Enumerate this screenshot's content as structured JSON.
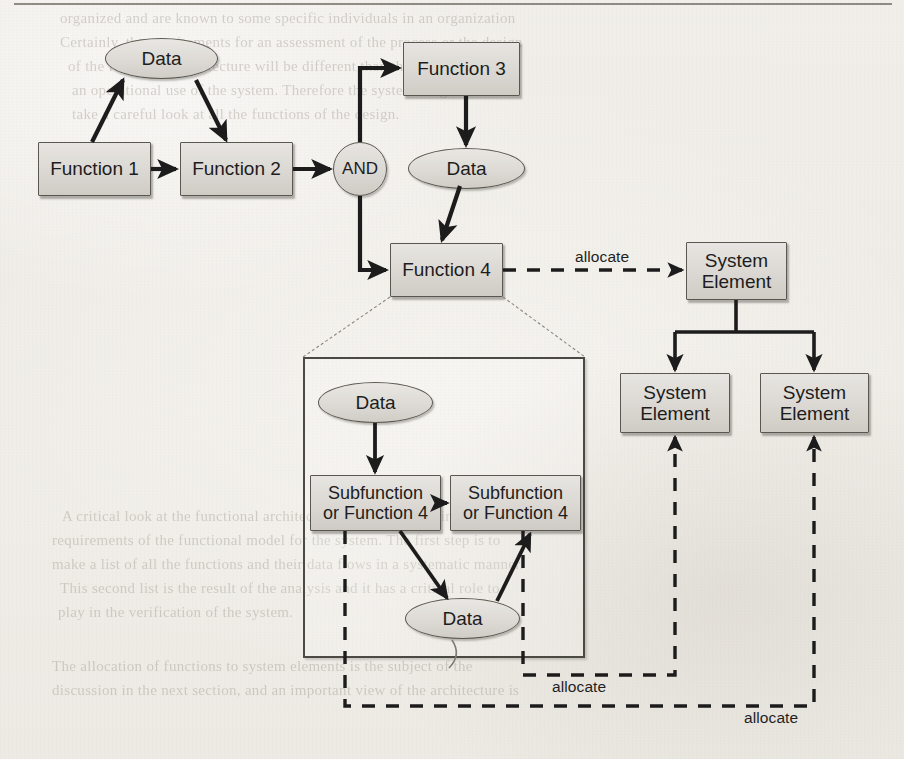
{
  "page": {
    "width": 904,
    "height": 759,
    "background_color": "#f1efea",
    "ink_color": "#1d1d1d",
    "node_fill_color": "#dcd9d4",
    "node_border_color": "#59574f"
  },
  "diagram": {
    "type": "functional-flow-allocation-diagram",
    "nodes": [
      {
        "id": "data-top",
        "shape": "ellipse",
        "label": "Data",
        "label2": "",
        "x": 105,
        "y": 38,
        "w": 113,
        "h": 41,
        "font_size": 19
      },
      {
        "id": "function-1",
        "shape": "box",
        "label": "Function 1",
        "label2": "",
        "x": 38,
        "y": 142,
        "w": 113,
        "h": 54,
        "font_size": 19
      },
      {
        "id": "function-2",
        "shape": "box",
        "label": "Function 2",
        "label2": "",
        "x": 180,
        "y": 142,
        "w": 113,
        "h": 54,
        "font_size": 19
      },
      {
        "id": "and-gate",
        "shape": "circle",
        "label": "AND",
        "label2": "",
        "x": 333,
        "y": 142,
        "w": 54,
        "h": 54,
        "font_size": 17
      },
      {
        "id": "function-3",
        "shape": "box",
        "label": "Function 3",
        "label2": "",
        "x": 403,
        "y": 42,
        "w": 117,
        "h": 54,
        "font_size": 19
      },
      {
        "id": "data-fn3",
        "shape": "ellipse",
        "label": "Data",
        "label2": "",
        "x": 408,
        "y": 148,
        "w": 117,
        "h": 41,
        "font_size": 19
      },
      {
        "id": "function-4",
        "shape": "box",
        "label": "Function 4",
        "label2": "",
        "x": 390,
        "y": 243,
        "w": 113,
        "h": 54,
        "font_size": 19
      },
      {
        "id": "system-element-top",
        "shape": "box",
        "label": "System",
        "label2": "Element",
        "x": 686,
        "y": 242,
        "w": 101,
        "h": 58,
        "font_size": 19
      },
      {
        "id": "system-element-left",
        "shape": "box",
        "label": "System",
        "label2": "Element",
        "x": 620,
        "y": 373,
        "w": 110,
        "h": 60,
        "font_size": 19
      },
      {
        "id": "system-element-right",
        "shape": "box",
        "label": "System",
        "label2": "Element",
        "x": 760,
        "y": 373,
        "w": 109,
        "h": 60,
        "font_size": 19
      },
      {
        "id": "data-sub-in",
        "shape": "ellipse",
        "label": "Data",
        "label2": "",
        "x": 318,
        "y": 382,
        "w": 115,
        "h": 41,
        "font_size": 19
      },
      {
        "id": "subfunction-left",
        "shape": "box",
        "label": "Subfunction",
        "label2": "or Function 4",
        "x": 310,
        "y": 475,
        "w": 131,
        "h": 56,
        "font_size": 18
      },
      {
        "id": "subfunction-right",
        "shape": "box",
        "label": "Subfunction",
        "label2": "or Function 4",
        "x": 450,
        "y": 475,
        "w": 131,
        "h": 56,
        "font_size": 18
      },
      {
        "id": "data-sub-out",
        "shape": "ellipse",
        "label": "Data",
        "label2": "",
        "x": 405,
        "y": 598,
        "w": 115,
        "h": 41,
        "font_size": 19
      }
    ],
    "container": {
      "id": "function-4-decomposition",
      "x": 303,
      "y": 357,
      "w": 282,
      "h": 301
    },
    "edge_labels": [
      {
        "id": "allocate-fn4",
        "text": "allocate",
        "x": 575,
        "y": 248
      },
      {
        "id": "allocate-subright",
        "text": "allocate",
        "x": 552,
        "y": 678
      },
      {
        "id": "allocate-subleft",
        "text": "allocate",
        "x": 744,
        "y": 709
      }
    ]
  },
  "ghost_text": {
    "note": "faint bleed-through text of the underlying printed book page",
    "lines": [
      {
        "text": "organized    and are known to some  specific  individuals in an organization",
        "x": 60,
        "y": 10,
        "size": 15
      },
      {
        "text": "Certainly, the requirements for an assessment of  the  process or the  design",
        "x": 60,
        "y": 34,
        "size": 15
      },
      {
        "text": "of   the   functional  architecture   will   be  different  than  the  requirements for",
        "x": 68,
        "y": 58,
        "size": 15
      },
      {
        "text": "an   operational  use  of   the   system.   Therefore  the  systems  engineer must",
        "x": 72,
        "y": 82,
        "size": 15
      },
      {
        "text": "take  a  careful  look  at  all  the   functions  of  the  design.",
        "x": 72,
        "y": 106,
        "size": 15
      },
      {
        "text": "A  critical  look  at  the  functional  architecture  is  needed  to  define  the",
        "x": 62,
        "y": 508,
        "size": 15
      },
      {
        "text": "requirements  of   the  functional  model  for  the  system.  The  first  step  is  to",
        "x": 52,
        "y": 532,
        "size": 15
      },
      {
        "text": "make  a  list  of  all  the  functions  and  their  data  flows  in  a  systematic  manner.",
        "x": 52,
        "y": 556,
        "size": 15
      },
      {
        "text": "This  second  list  is  the  result  of  the  analysis  and  it  has  a  critical  role  to",
        "x": 60,
        "y": 580,
        "size": 15
      },
      {
        "text": "play  in  the  verification  of  the  system.",
        "x": 58,
        "y": 604,
        "size": 15
      },
      {
        "text": "The   allocation   of   functions   to   system   elements   is   the   subject   of   the",
        "x": 52,
        "y": 658,
        "size": 15
      },
      {
        "text": "discussion  in  the  next  section,  and  an  important  view  of  the  architecture  is",
        "x": 52,
        "y": 682,
        "size": 15
      }
    ]
  }
}
